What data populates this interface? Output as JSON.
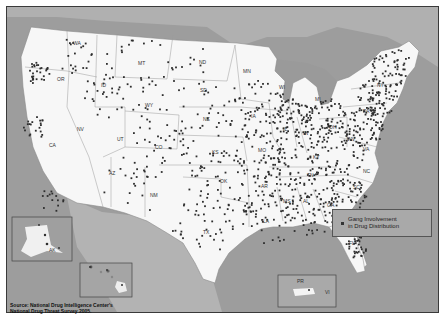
{
  "map": {
    "title": "Gang Involvement in Drug Distribution",
    "legend": {
      "symbol": "dot",
      "label_line1": "Gang Involvement",
      "label_line2": "in Drug Distribution"
    },
    "source_line1": "Source: National Drug Intelligence Center's",
    "source_line2": "National Drug Threat Survey 2005.",
    "colors": {
      "land": "#f7f7f7",
      "water": "#9d9d9d",
      "neighbor_land": "#b5b5b5",
      "dot": "#2e2e2e",
      "border": "#8a8a8a"
    },
    "insets": [
      {
        "name": "Alaska",
        "label": "AK"
      },
      {
        "name": "Hawaii",
        "label": "HI"
      },
      {
        "name": "Puerto Rico / Virgin Islands",
        "label": "PR",
        "label2": "VI"
      }
    ],
    "state_labels": [
      {
        "abbr": "WA",
        "x": 66,
        "y": 38
      },
      {
        "abbr": "OR",
        "x": 50,
        "y": 74
      },
      {
        "abbr": "CA",
        "x": 42,
        "y": 140
      },
      {
        "abbr": "NV",
        "x": 70,
        "y": 124
      },
      {
        "abbr": "ID",
        "x": 94,
        "y": 80
      },
      {
        "abbr": "MT",
        "x": 131,
        "y": 58
      },
      {
        "abbr": "WY",
        "x": 138,
        "y": 100
      },
      {
        "abbr": "UT",
        "x": 110,
        "y": 134
      },
      {
        "abbr": "CO",
        "x": 148,
        "y": 142
      },
      {
        "abbr": "AZ",
        "x": 102,
        "y": 168
      },
      {
        "abbr": "NM",
        "x": 143,
        "y": 190
      },
      {
        "abbr": "ND",
        "x": 192,
        "y": 57
      },
      {
        "abbr": "SD",
        "x": 193,
        "y": 85
      },
      {
        "abbr": "NE",
        "x": 196,
        "y": 114
      },
      {
        "abbr": "KS",
        "x": 205,
        "y": 147
      },
      {
        "abbr": "OK",
        "x": 213,
        "y": 176
      },
      {
        "abbr": "TX",
        "x": 196,
        "y": 227
      },
      {
        "abbr": "MN",
        "x": 236,
        "y": 66
      },
      {
        "abbr": "IA",
        "x": 244,
        "y": 111
      },
      {
        "abbr": "MO",
        "x": 251,
        "y": 145
      },
      {
        "abbr": "AR",
        "x": 254,
        "y": 181
      },
      {
        "abbr": "LA",
        "x": 256,
        "y": 216
      },
      {
        "abbr": "WI",
        "x": 272,
        "y": 82
      },
      {
        "abbr": "IL",
        "x": 276,
        "y": 124
      },
      {
        "abbr": "MS",
        "x": 276,
        "y": 196
      },
      {
        "abbr": "MI",
        "x": 308,
        "y": 94
      },
      {
        "abbr": "IN",
        "x": 296,
        "y": 128
      },
      {
        "abbr": "KY",
        "x": 306,
        "y": 152
      },
      {
        "abbr": "TN",
        "x": 300,
        "y": 170
      },
      {
        "abbr": "AL",
        "x": 296,
        "y": 196
      },
      {
        "abbr": "OH",
        "x": 322,
        "y": 122
      },
      {
        "abbr": "GA",
        "x": 320,
        "y": 200
      },
      {
        "abbr": "FL",
        "x": 342,
        "y": 238
      },
      {
        "abbr": "WV",
        "x": 340,
        "y": 134
      },
      {
        "abbr": "VA",
        "x": 356,
        "y": 144
      },
      {
        "abbr": "NC",
        "x": 356,
        "y": 166
      },
      {
        "abbr": "SC",
        "x": 346,
        "y": 182
      },
      {
        "abbr": "PA",
        "x": 356,
        "y": 106
      },
      {
        "abbr": "NY",
        "x": 370,
        "y": 80
      }
    ]
  }
}
